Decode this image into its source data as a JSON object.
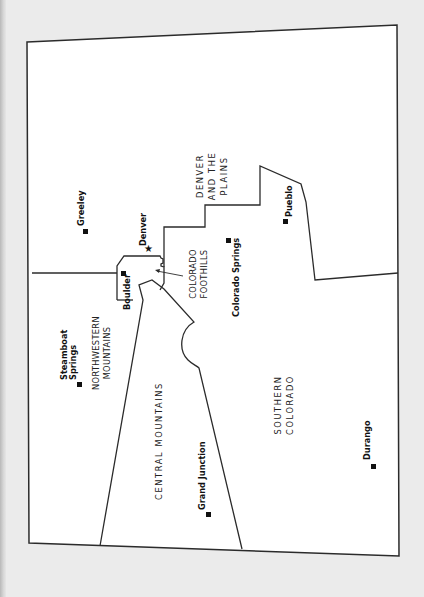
{
  "map": {
    "title": "Colorado regions",
    "orientation": "rotated 90° clockwise (north points left)",
    "colors": {
      "land": "#ffffff",
      "border": "#2b2b2b",
      "background": "#ebebeb",
      "text": "#222222"
    },
    "regions": [
      {
        "id": "denver-plains",
        "lines": [
          "DENVER",
          "AND THE",
          "PLAINS"
        ]
      },
      {
        "id": "northwestern-mountains",
        "lines": [
          "NORTHWESTERN",
          "MOUNTAINS"
        ]
      },
      {
        "id": "central-mountains",
        "lines": [
          "CENTRAL MOUNTAINS"
        ]
      },
      {
        "id": "colorado-foothills",
        "lines": [
          "COLORADO",
          "FOOTHILLS"
        ]
      },
      {
        "id": "southern-colorado",
        "lines": [
          "SOUTHERN",
          "COLORADO"
        ]
      }
    ],
    "cities": [
      {
        "name": "Greeley",
        "marker": "square"
      },
      {
        "name": "Denver",
        "marker": "star"
      },
      {
        "name": "Boulder",
        "marker": "square"
      },
      {
        "name": "Colorado Springs",
        "marker": "square"
      },
      {
        "name": "Pueblo",
        "marker": "square"
      },
      {
        "name": "Steamboat",
        "name_line2": "Springs",
        "marker": "square"
      },
      {
        "name": "Grand Junction",
        "marker": "square"
      },
      {
        "name": "Durango",
        "marker": "square"
      }
    ]
  }
}
